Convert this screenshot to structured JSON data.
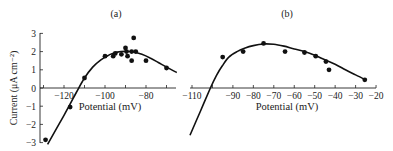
{
  "chart_data": [
    {
      "panel": "(a)",
      "type": "scatter",
      "title": "(a)",
      "xlabel": "Potential (mV)",
      "ylabel": "Current (μA cm⁻²)",
      "xlim": [
        -133,
        -65
      ],
      "ylim": [
        -3,
        3
      ],
      "xticks": [
        -130,
        -120,
        -110,
        -100,
        -90,
        -80,
        -70
      ],
      "xtick_labels": [
        "",
        "−120",
        "",
        "−100",
        "",
        "−80",
        ""
      ],
      "yticks": [
        3,
        2,
        1,
        0,
        -1,
        -2,
        -3
      ],
      "ytick_labels": [
        "3",
        "2",
        "1",
        "0",
        "−1",
        "−2",
        "−3"
      ],
      "grid": false,
      "series": [
        {
          "name": "measured",
          "type": "scatter",
          "x": [
            -129,
            -117,
            -110,
            -100,
            -96,
            -95,
            -92,
            -90,
            -89.5,
            -89,
            -87,
            -87,
            -86,
            -85,
            -80,
            -70
          ],
          "y": [
            -2.85,
            -1.05,
            0.55,
            1.75,
            1.75,
            1.9,
            1.85,
            2.2,
            2.0,
            1.75,
            2.0,
            1.5,
            2.75,
            2.0,
            1.5,
            1.1
          ]
        },
        {
          "name": "fit",
          "type": "line",
          "x": [
            -128,
            -120,
            -114,
            -110,
            -106,
            -102,
            -98,
            -94,
            -90,
            -86,
            -82,
            -78,
            -74,
            -70,
            -65
          ],
          "y": [
            -3.1,
            -1.5,
            -0.25,
            0.55,
            1.15,
            1.55,
            1.82,
            1.97,
            2.02,
            1.98,
            1.85,
            1.65,
            1.4,
            1.15,
            0.85
          ]
        }
      ]
    },
    {
      "panel": "(b)",
      "type": "scatter",
      "title": "(b)",
      "xlabel": "Potential (mV)",
      "ylabel": "Current (μA cm⁻²)",
      "xlim": [
        -110,
        -20
      ],
      "ylim": [
        -3,
        3
      ],
      "xticks": [
        -110,
        -100,
        -90,
        -80,
        -70,
        -60,
        -50,
        -40,
        -30,
        -20
      ],
      "xtick_labels": [
        "−110",
        "",
        "−90",
        "−80",
        "−70",
        "−60",
        "−50",
        "−40",
        "−30",
        "−20"
      ],
      "grid": false,
      "series": [
        {
          "name": "measured",
          "type": "scatter",
          "x": [
            -95,
            -85,
            -75,
            -64.5,
            -55,
            -49.5,
            -44.5,
            -43,
            -25.5
          ],
          "y": [
            1.7,
            2.0,
            2.45,
            2.0,
            1.95,
            1.75,
            1.45,
            1.0,
            0.45
          ]
        },
        {
          "name": "fit",
          "type": "line",
          "x": [
            -111,
            -106,
            -101,
            -98,
            -95,
            -92,
            -88,
            -84,
            -80,
            -75,
            -70,
            -65,
            -60,
            -55,
            -50,
            -45,
            -40,
            -35,
            -30,
            -25
          ],
          "y": [
            -2.6,
            -1.3,
            0.0,
            0.7,
            1.25,
            1.7,
            2.0,
            2.2,
            2.33,
            2.42,
            2.4,
            2.3,
            2.15,
            2.0,
            1.8,
            1.55,
            1.3,
            1.0,
            0.72,
            0.45
          ]
        }
      ]
    }
  ],
  "labels": {
    "panel_a_title": "(a)",
    "panel_b_title": "(b)",
    "ylabel": "Current (μA cm⁻²)",
    "xlabel_a": "Potential (mV)",
    "xlabel_b": "Potential (mV)"
  }
}
